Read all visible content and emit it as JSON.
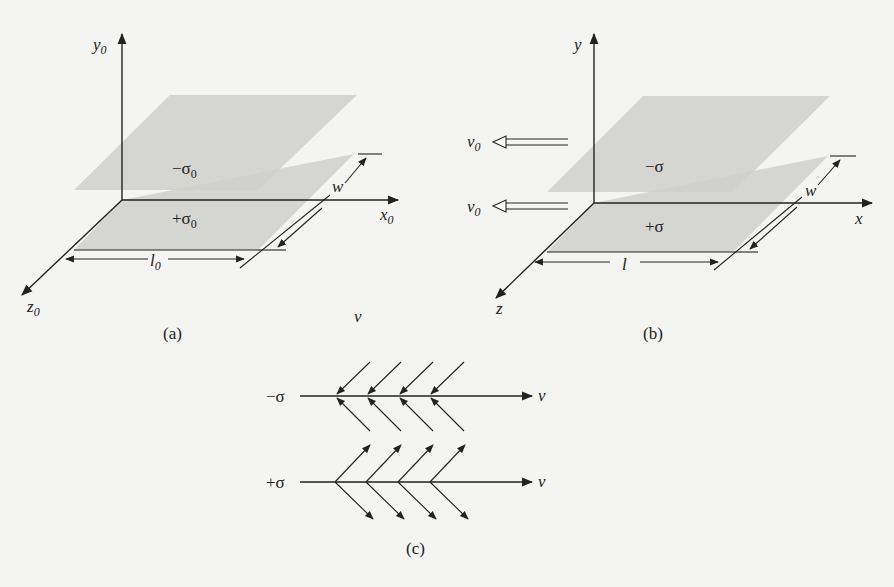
{
  "figure": {
    "panels": [
      {
        "id": "a",
        "caption": "(a)",
        "axes": {
          "x": "x",
          "x_sub": "0",
          "y": "y",
          "y_sub": "0",
          "z": "z",
          "z_sub": "0"
        },
        "top_plate_label": "−σ",
        "top_plate_sub": "0",
        "bottom_plate_label": "+σ",
        "bottom_plate_sub": "0",
        "length_label": "l",
        "length_sub": "0",
        "width_label": "w"
      },
      {
        "id": "b",
        "caption": "(b)",
        "axes": {
          "x": "x",
          "y": "y",
          "z": "z"
        },
        "top_plate_label": "−σ",
        "bottom_plate_label": "+σ",
        "length_label": "l",
        "width_label": "w",
        "velocity_label": "v",
        "velocity_sub": "0"
      },
      {
        "id": "c",
        "caption": "(c)",
        "top_line_label": "−σ",
        "bottom_line_label": "+σ",
        "velocity_label": "v",
        "field_arrow_count_per_line": 4
      }
    ],
    "stray_label": "v"
  }
}
